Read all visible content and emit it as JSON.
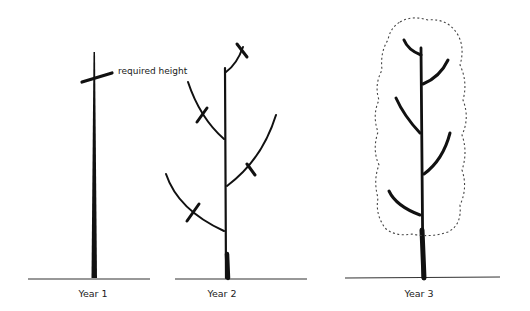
{
  "diagram": {
    "annotation": "required height",
    "stages": [
      {
        "caption": "Year 1",
        "description": "single unbranched whip with cut mark at required height"
      },
      {
        "caption": "Year 2",
        "description": "leader with four side branches and a top shoot, each marked with a pruning cut"
      },
      {
        "caption": "Year 3",
        "description": "leader with five side branches, dotted outline showing columnar crown"
      }
    ],
    "colors": {
      "ink": "#111111",
      "outline": "#444444",
      "background": "#ffffff"
    }
  }
}
